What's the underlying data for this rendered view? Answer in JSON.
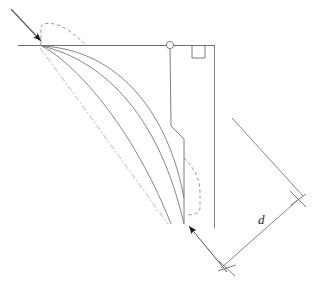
{
  "figure": {
    "background_color": "#ffffff",
    "width": 327,
    "height": 285
  },
  "styles": {
    "line_color": "#6e6e6e",
    "curve_color": "#787878",
    "dashed_color": "#8a8a8a",
    "dashdot_color": "#c9c9c9",
    "arrow_fill": "#1a1a1a",
    "dimension_color": "#6e6e6e",
    "label_color": "#2b2b2b",
    "stroke_width": 0.9
  },
  "labels": {
    "dimension_d": "d"
  },
  "icons": {
    "hinge": "hinge-circle-icon",
    "right_angle": "right-angle-marker-icon",
    "motion_arrow_top": "arrowhead-icon",
    "motion_arrow_bottom": "arrowhead-icon",
    "tick_upper": "x-tick-icon",
    "tick_lower": "x-tick-icon"
  },
  "geometry": {
    "top_beam": {
      "x1": 18,
      "y1": 45,
      "x2": 215,
      "y2": 45
    },
    "incoming_arrow_line": {
      "x1": 11,
      "y1": 9,
      "x2": 42,
      "y2": 42
    },
    "hinge_circle": {
      "cx": 170,
      "cy": 45,
      "r": 3.6
    },
    "right_angle_marker": {
      "x": 192,
      "y": 45,
      "size": 13
    },
    "right_vertical": {
      "x1": 214,
      "y1": 45,
      "x2": 214,
      "y2": 228
    },
    "kinked_post": [
      {
        "x": 170,
        "y": 49
      },
      {
        "x": 171,
        "y": 126
      },
      {
        "x": 184,
        "y": 139
      },
      {
        "x": 184,
        "y": 224
      }
    ],
    "curve_outer": {
      "start": {
        "x": 42,
        "y": 46
      },
      "c1": {
        "x": 108,
        "y": 62
      },
      "c2": {
        "x": 160,
        "y": 120
      },
      "end": {
        "x": 184,
        "y": 224
      }
    },
    "curve_inner": {
      "start": {
        "x": 42,
        "y": 46
      },
      "c1": {
        "x": 88,
        "y": 72
      },
      "c2": {
        "x": 140,
        "y": 145
      },
      "end": {
        "x": 171,
        "y": 224
      }
    },
    "curve_topmost": {
      "start": {
        "x": 42,
        "y": 46
      },
      "c1": {
        "x": 118,
        "y": 50
      },
      "c2": {
        "x": 166,
        "y": 110
      },
      "end": {
        "x": 184,
        "y": 196
      }
    },
    "dashdot_centerline": {
      "start": {
        "x": 40,
        "y": 48
      },
      "c1": {
        "x": 70,
        "y": 88
      },
      "c2": {
        "x": 118,
        "y": 155
      },
      "end": {
        "x": 168,
        "y": 224
      }
    },
    "dashed_loop_top": [
      {
        "x": 41,
        "y": 45
      },
      {
        "x": 41,
        "y": 26
      },
      {
        "x": 52,
        "y": 23
      },
      {
        "x": 68,
        "y": 30
      },
      {
        "x": 86,
        "y": 45
      }
    ],
    "dashed_loop_bottom": [
      {
        "x": 184,
        "y": 160
      },
      {
        "x": 198,
        "y": 172
      },
      {
        "x": 200,
        "y": 188
      },
      {
        "x": 200,
        "y": 210
      },
      {
        "x": 186,
        "y": 215
      }
    ],
    "dimension_line": {
      "x1": 221,
      "y1": 268,
      "x2": 298,
      "y2": 199
    },
    "extension_upper": {
      "x1": 232,
      "y1": 118,
      "x2": 303,
      "y2": 196
    },
    "extension_lower": {
      "x1": 186,
      "y1": 223,
      "x2": 227,
      "y2": 272
    },
    "tick_upper": {
      "cx": 298,
      "cy": 199
    },
    "tick_lower": {
      "cx": 227,
      "cy": 268
    },
    "label_d_pos": {
      "x": 258,
      "y": 222
    }
  }
}
